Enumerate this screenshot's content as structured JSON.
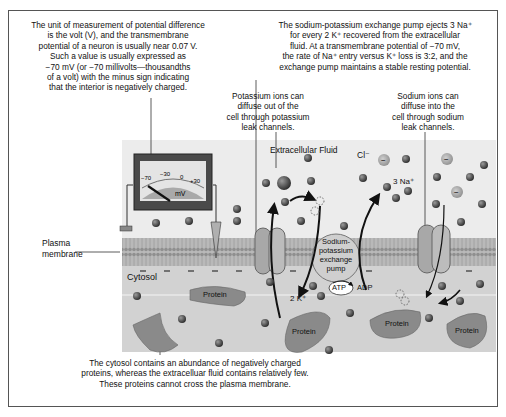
{
  "captions": {
    "voltage": [
      "The unit of measurement of potential difference",
      "is the volt (V), and the transmembrane",
      "potential of a neuron is usually near 0.07 V.",
      "Such a value is usually expressed as",
      "−70 mV (or −70 millivolts—thousandths",
      "of a volt) with the minus sign indicating",
      "that the interior is negatively charged."
    ],
    "pump": [
      "The sodium-potassium exchange pump ejects 3 Na⁺",
      "for every 2 K⁺ recovered from the extracellular",
      "fluid. At a transmembrane potential of −70 mV,",
      "the rate of Na⁺ entry versus K⁺ loss is 3:2, and the",
      "exchange pump maintains a stable resting potential."
    ],
    "potassium": [
      "Potassium ions can",
      "diffuse out of the",
      "cell through potassium",
      "leak channels."
    ],
    "sodium": [
      "Sodium ions can",
      "diffuse into the",
      "cell through sodium",
      "leak channels."
    ],
    "proteins": [
      "The cytosol contains an abundance of negatively charged",
      "proteins, whereas the extracelluar fluid contains relatively few.",
      "These proteins cannot cross the plasma membrane."
    ]
  },
  "labels": {
    "extracellular": "Extracellular Fluid",
    "plasma_membrane_1": "Plasma",
    "plasma_membrane_2": "membrane",
    "cytosol": "Cytosol",
    "chloride": "Cl⁻",
    "sodium_count": "3 Na⁺",
    "potassium_count": "2 K⁺",
    "atp": "ATP",
    "adp": "ADP",
    "pump": [
      "Sodium-",
      "potassium",
      "exchange",
      "pump"
    ],
    "protein": "Protein"
  },
  "voltmeter": {
    "ticks": [
      "−70",
      "−30",
      "0",
      "+30"
    ],
    "unit": "mV",
    "reading": "−70"
  }
}
